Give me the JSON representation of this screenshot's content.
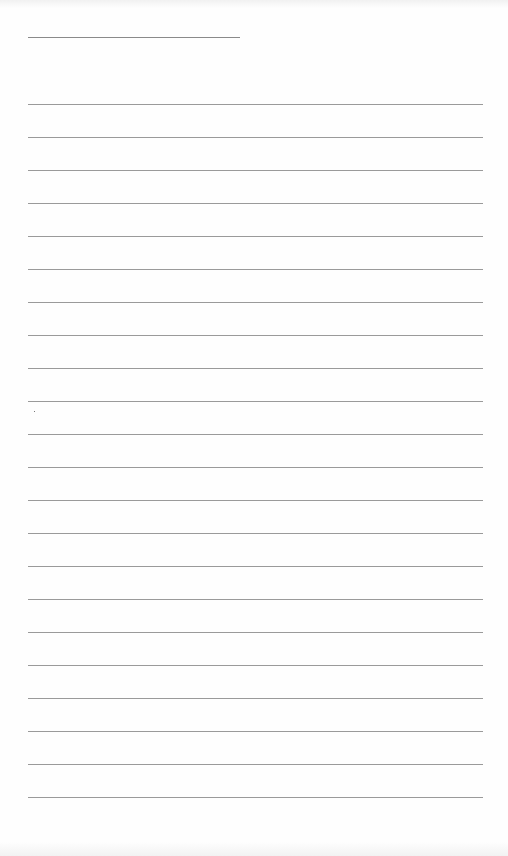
{
  "page": {
    "type": "lined-notepaper",
    "header_line": {
      "left": 28,
      "top": 37,
      "width": 212
    },
    "rules": {
      "left": 28,
      "width": 455,
      "start_top": 104,
      "spacing": 33,
      "count": 22
    },
    "colors": {
      "paper": "#fefefe",
      "rule": "#9a9a9a",
      "header_line": "#8a8a8a"
    },
    "marks": [
      {
        "x": 34,
        "y": 411
      }
    ]
  }
}
